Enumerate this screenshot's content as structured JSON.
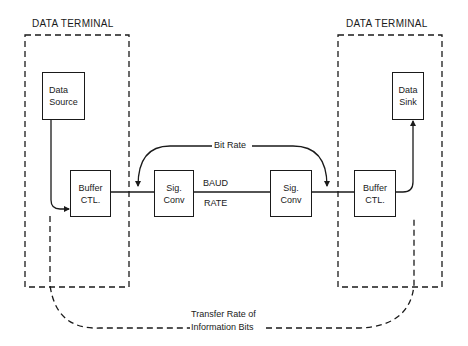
{
  "diagram": {
    "left_terminal": {
      "title": "DATA TERMINAL",
      "source_box": {
        "line1": "Data",
        "line2": "Source"
      },
      "buffer_box": {
        "line1": "Buffer",
        "line2": "CTL."
      }
    },
    "right_terminal": {
      "title": "DATA TERMINAL",
      "sink_box": {
        "line1": "Data",
        "line2": "Sink"
      },
      "buffer_box": {
        "line1": "Buffer",
        "line2": "CTL."
      }
    },
    "left_sigconv": {
      "line1": "Sig.",
      "line2": "Conv"
    },
    "right_sigconv": {
      "line1": "Sig.",
      "line2": "Conv"
    },
    "bit_rate_label": "Bit Rate",
    "baud_label": "BAUD",
    "rate_label": "RATE",
    "transfer_label_line1": "Transfer Rate of",
    "transfer_label_line2": "Information Bits",
    "colors": {
      "line": "#1a1a1a",
      "background": "#ffffff"
    }
  }
}
